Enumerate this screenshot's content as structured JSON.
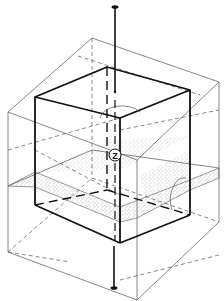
{
  "diagram": {
    "title": "",
    "axis_label": "Z",
    "colors": {
      "line": "#111111",
      "thin_line": "#555555",
      "stipple": "#777777",
      "background": "#ffffff"
    },
    "elements": [
      {
        "name": "vertical-axis",
        "label": "Z"
      },
      {
        "name": "inner-cube",
        "style": "thick outline"
      },
      {
        "name": "outer-box",
        "style": "thin outline"
      },
      {
        "name": "section-plane",
        "style": "stippled"
      },
      {
        "name": "rotation-arc-top"
      },
      {
        "name": "rotation-arc-right"
      }
    ]
  }
}
